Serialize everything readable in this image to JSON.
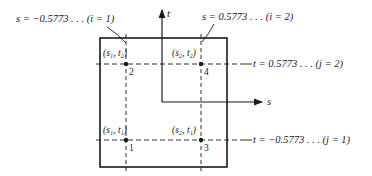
{
  "diagram": {
    "axes": {
      "t_label": "t",
      "s_label": "s"
    },
    "annotations": {
      "s_i1": "s = −0.5773 . . . (i = 1)",
      "s_i2": "s = 0.5773 . . . (i = 2)",
      "t_j2": "t = 0.5773 . . . (j = 2)",
      "t_j1": "t = −0.5773 . . . (j = 1)"
    },
    "points": [
      {
        "label": "(s₁, t₁)",
        "number": "1"
      },
      {
        "label": "(s₁, t₂)",
        "number": "2"
      },
      {
        "label": "(s₂, t₁)",
        "number": "3"
      },
      {
        "label": "(s₂, t₂)",
        "number": "4"
      }
    ],
    "colors": {
      "ink": "#1a1a1a",
      "background": "#ffffff"
    }
  }
}
